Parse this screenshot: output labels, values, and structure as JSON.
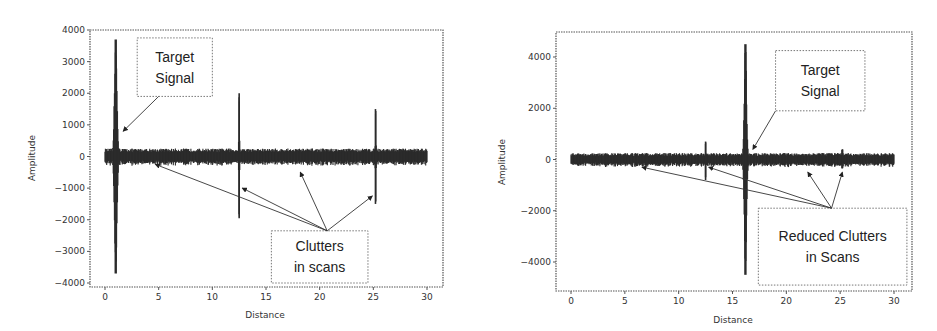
{
  "chart_data": [
    {
      "type": "line",
      "name": "before-clutter-reduction",
      "xlabel": "Distance",
      "ylabel": "Amplitude",
      "xlim": [
        -0.5,
        31
      ],
      "ylim": [
        -4100,
        4100
      ],
      "xticks": [
        0,
        5,
        10,
        15,
        20,
        25,
        30
      ],
      "xtick_labels": [
        "0",
        "5",
        "10",
        "15",
        "20",
        "25",
        "30"
      ],
      "yticks": [
        4000,
        3000,
        2000,
        1000,
        0,
        -1000,
        -2000,
        -3000,
        -4000
      ],
      "ytick_labels": [
        "4000",
        "3000",
        "2000",
        "1000",
        "0",
        "−1000",
        "−2000",
        "−3000",
        "−4000"
      ],
      "signal": {
        "x_range": [
          0,
          30
        ],
        "noise_amplitude": 250,
        "events": [
          {
            "label": "target",
            "x": 1.0,
            "max": 3700,
            "min": -3700,
            "width": 0.5
          },
          {
            "label": "clutter",
            "x": 12.5,
            "max": 2000,
            "min": -1950,
            "width": 0.08
          },
          {
            "label": "clutter",
            "x": 25.2,
            "max": 1500,
            "min": -1500,
            "width": 0.08
          }
        ]
      },
      "annotations": [
        {
          "label": "target-signal",
          "lines": [
            "Target",
            "Signal"
          ],
          "box": [
            3.0,
            3750,
            10.0,
            1900
          ],
          "from": [
            5.0,
            1900
          ],
          "to": [
            1.7,
            800
          ]
        },
        {
          "label": "clutters",
          "lines": [
            "Clutters",
            "in scans"
          ],
          "box": [
            15.5,
            -2350,
            24.5,
            -4000
          ],
          "from": [
            20.7,
            -2350
          ],
          "to": [
            [
              4.7,
              -250
            ],
            [
              12.8,
              -1000
            ],
            [
              18.2,
              -500
            ],
            [
              24.9,
              -1250
            ]
          ]
        }
      ],
      "legend": "none",
      "grid": false
    },
    {
      "type": "line",
      "name": "after-clutter-reduction",
      "xlabel": "Distance",
      "ylabel": "Amplitude",
      "xlim": [
        -0.5,
        31
      ],
      "ylim": [
        -5000,
        5000
      ],
      "xticks": [
        0,
        5,
        10,
        15,
        20,
        25,
        30
      ],
      "xtick_labels": [
        "0",
        "5",
        "10",
        "15",
        "20",
        "25",
        "30"
      ],
      "yticks": [
        4000,
        2000,
        0,
        -2000,
        -4000
      ],
      "ytick_labels": [
        "4000",
        "2000",
        "0",
        "−2000",
        "−4000"
      ],
      "signal": {
        "x_range": [
          0,
          30
        ],
        "noise_amplitude": 250,
        "events": [
          {
            "label": "target",
            "x": 16.2,
            "max": 4500,
            "min": -4500,
            "width": 0.45
          },
          {
            "label": "clutter",
            "x": 12.5,
            "max": 700,
            "min": -800,
            "width": 0.1
          },
          {
            "label": "clutter",
            "x": 25.2,
            "max": 400,
            "min": -350,
            "width": 0.1
          }
        ]
      },
      "annotations": [
        {
          "label": "target-signal",
          "lines": [
            "Target",
            "Signal"
          ],
          "box": [
            19.0,
            4250,
            27.3,
            1900
          ],
          "from": [
            19.0,
            1900
          ],
          "to": [
            16.9,
            400
          ]
        },
        {
          "label": "reduced-clutters",
          "lines": [
            "Reduced Clutters",
            "in Scans"
          ],
          "box": [
            17.4,
            -1900,
            31.2,
            -4900
          ],
          "from": [
            24.2,
            -1900
          ],
          "to": [
            [
              6.6,
              -300
            ],
            [
              12.8,
              -300
            ],
            [
              22.0,
              -500
            ],
            [
              25.2,
              -500
            ]
          ]
        }
      ],
      "legend": "none",
      "grid": false
    }
  ]
}
